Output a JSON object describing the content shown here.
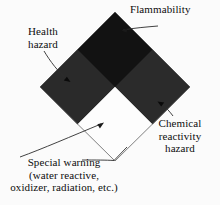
{
  "diagram": {
    "background_color": "#fbfbfb",
    "quadrants": {
      "top": {
        "name": "flammability",
        "color": "#121212"
      },
      "left": {
        "name": "health-hazard",
        "color": "#2a2a2a"
      },
      "right": {
        "name": "chemical-reactivity-hazard",
        "color": "#2b2b2b"
      },
      "bottom": {
        "name": "special-warning",
        "color": "#fdfdfd"
      }
    },
    "outline_color": "#555555"
  },
  "labels": {
    "flammability": {
      "lines": [
        "Flammability"
      ]
    },
    "health": {
      "lines": [
        "Health",
        "hazard"
      ]
    },
    "reactivity": {
      "lines": [
        "Chemical",
        "reactivity",
        "hazard"
      ]
    },
    "special": {
      "lines": [
        "Special warning",
        "(water reactive,",
        "oxidizer, radiation, etc.)"
      ]
    }
  }
}
